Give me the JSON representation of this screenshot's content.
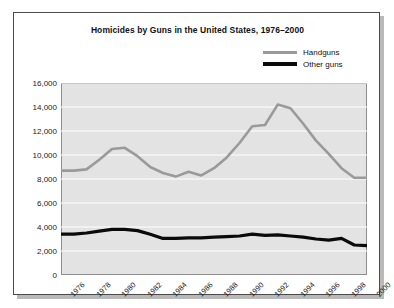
{
  "chart_data": {
    "type": "line",
    "title": "Homicides by Guns in the United States, 1976–2000",
    "xlabel": "",
    "ylabel": "",
    "ylim": [
      0,
      16000
    ],
    "yticks": [
      0,
      2000,
      4000,
      6000,
      8000,
      10000,
      12000,
      14000,
      16000
    ],
    "ytick_labels": [
      "0",
      "2,000",
      "4,000",
      "6,000",
      "8,000",
      "10,000",
      "12,000",
      "14,000",
      "16,000"
    ],
    "x": [
      1976,
      1977,
      1978,
      1979,
      1980,
      1981,
      1982,
      1983,
      1984,
      1985,
      1986,
      1987,
      1988,
      1989,
      1990,
      1991,
      1992,
      1993,
      1994,
      1995,
      1996,
      1997,
      1998,
      1999,
      2000
    ],
    "xtick_labels": [
      "1976",
      "1978",
      "1980",
      "1982",
      "1984",
      "1986",
      "1988",
      "1990",
      "1992",
      "1994",
      "1996",
      "1998",
      "2000"
    ],
    "xticks": [
      1976,
      1978,
      1980,
      1982,
      1984,
      1986,
      1988,
      1990,
      1992,
      1994,
      1996,
      1998,
      2000
    ],
    "grid": true,
    "grid_color": "#ffffff",
    "plot_background": "#e3e3e3",
    "legend_position": "top-right",
    "series": [
      {
        "name": "Handguns",
        "color": "#9a9a9a",
        "width": 2.6,
        "values": [
          8700,
          8700,
          8800,
          9600,
          10500,
          10600,
          9900,
          9000,
          8500,
          8200,
          8600,
          8300,
          8900,
          9800,
          11000,
          12400,
          12500,
          14200,
          13900,
          12600,
          11200,
          10100,
          8900,
          8100,
          8100
        ]
      },
      {
        "name": "Other guns",
        "color": "#0a0a0a",
        "width": 3.2,
        "values": [
          3400,
          3400,
          3500,
          3650,
          3800,
          3800,
          3700,
          3400,
          3050,
          3050,
          3100,
          3100,
          3150,
          3200,
          3250,
          3400,
          3300,
          3350,
          3250,
          3150,
          3000,
          2900,
          3050,
          2500,
          2450
        ]
      }
    ]
  }
}
